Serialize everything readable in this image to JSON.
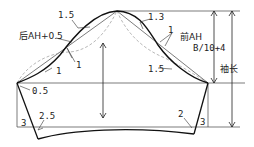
{
  "diagram": {
    "type": "sleeve-pattern",
    "labels": {
      "top_left_ease": "1.5",
      "top_right_ease": "1.3",
      "back_ah": "后AH+0.5",
      "front_ah": "前AH",
      "cap_height": "B/10+4",
      "sleeve_length": "袖长",
      "back_mid_1a": "1",
      "back_mid_1b": "1",
      "back_low_1": "1",
      "front_mid_1": "1",
      "front_low": "1.5",
      "back_underarm": "0.5",
      "back_hem_offset": "2.5",
      "back_hem_3": "3",
      "front_hem_offset": "2",
      "front_hem_3": "3"
    }
  }
}
